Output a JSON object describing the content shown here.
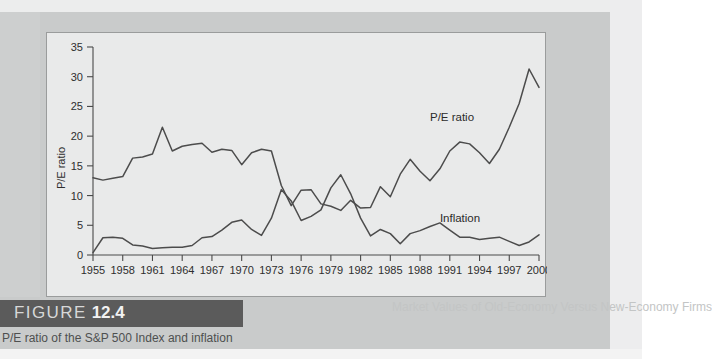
{
  "figure": {
    "banner_label": "FIGURE",
    "banner_number": "12.4",
    "caption": "P/E ratio of the S&P 500 Index and inflation"
  },
  "bleed_through": {
    "line1": "been mixed and not all be",
    "line2": "companies do technology and",
    "line3": "economy. Nor do companies",
    "line4": "don't it is companies of we",
    "line5": "Online Chat companies and",
    "line6": "sales in the 10 economy the",
    "line7": "creative can companies in",
    "line8": "Market Values of Old-Economy Versus New-Economy Firms"
  },
  "chart_data": {
    "type": "line",
    "title": "",
    "xlabel": "",
    "ylabel": "P/E ratio",
    "xlim": [
      1955,
      2000
    ],
    "ylim": [
      0,
      35
    ],
    "ytick_labels": [
      "0",
      "5",
      "10",
      "15",
      "20",
      "25",
      "30",
      "35"
    ],
    "yticks": [
      0,
      5,
      10,
      15,
      20,
      25,
      30,
      35
    ],
    "xtick_labels": [
      "1955",
      "1958",
      "1961",
      "1964",
      "1967",
      "1970",
      "1973",
      "1976",
      "1979",
      "1982",
      "1985",
      "1988",
      "1991",
      "1994",
      "1997",
      "2000"
    ],
    "xticks": [
      1955,
      1958,
      1961,
      1964,
      1967,
      1970,
      1973,
      1976,
      1979,
      1982,
      1985,
      1988,
      1991,
      1994,
      1997,
      2000
    ],
    "grid": false,
    "legend_position": "inline-annotations",
    "line_color": "#4c4c4c",
    "x": [
      1955,
      1956,
      1957,
      1958,
      1959,
      1960,
      1961,
      1962,
      1963,
      1964,
      1965,
      1966,
      1967,
      1968,
      1969,
      1970,
      1971,
      1972,
      1973,
      1974,
      1975,
      1976,
      1977,
      1978,
      1979,
      1980,
      1981,
      1982,
      1983,
      1984,
      1985,
      1986,
      1987,
      1988,
      1989,
      1990,
      1991,
      1992,
      1993,
      1994,
      1995,
      1996,
      1997,
      1998,
      1999,
      2000
    ],
    "series": [
      {
        "name": "P/E ratio",
        "label": "P/E ratio",
        "label_x": 1989,
        "label_y": 22.5,
        "values": [
          13.0,
          12.6,
          12.9,
          13.2,
          16.3,
          16.5,
          17.0,
          21.5,
          17.5,
          18.3,
          18.6,
          18.8,
          17.3,
          17.8,
          17.6,
          15.2,
          17.2,
          17.8,
          17.5,
          11.7,
          8.3,
          10.9,
          11.0,
          8.6,
          8.2,
          7.5,
          9.2,
          7.9,
          8.0,
          11.5,
          9.8,
          13.6,
          16.1,
          14.1,
          12.5,
          14.5,
          17.5,
          19.0,
          18.7,
          17.2,
          15.4,
          17.8,
          21.5,
          25.5,
          31.3,
          28.2
        ]
      },
      {
        "name": "Inflation",
        "label": "Inflation",
        "label_x": 1990,
        "label_y": 5.6,
        "values": [
          0.4,
          2.9,
          3.0,
          2.8,
          1.7,
          1.5,
          1.1,
          1.2,
          1.3,
          1.3,
          1.6,
          2.9,
          3.1,
          4.2,
          5.5,
          5.9,
          4.3,
          3.3,
          6.2,
          11.0,
          9.1,
          5.8,
          6.5,
          7.6,
          11.3,
          13.5,
          10.3,
          6.2,
          3.2,
          4.3,
          3.6,
          1.9,
          3.6,
          4.1,
          4.8,
          5.4,
          4.2,
          3.0,
          3.0,
          2.6,
          2.8,
          3.0,
          2.3,
          1.6,
          2.2,
          3.4
        ]
      }
    ]
  }
}
